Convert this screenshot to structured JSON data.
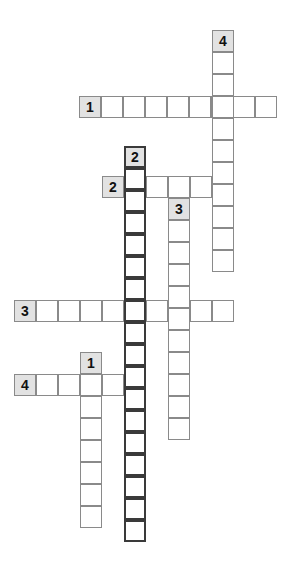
{
  "puzzle": {
    "title": "Crossword Grid",
    "cell_size": 22,
    "width": 298,
    "height": 582,
    "colors": {
      "background": "#ffffff",
      "cell_fill": "#ffffff",
      "cell_border": "#8a8a8a",
      "bold_border": "#3a3a3a",
      "clue_cell_fill": "#e2e2e2",
      "number_color": "#111111"
    },
    "entries": [
      {
        "id": "1-across",
        "number": "1",
        "direction": "across",
        "length": 9,
        "x": 79,
        "y": 96,
        "bold": false,
        "clue_cell": {
          "x": 79,
          "y": 96
        }
      },
      {
        "id": "2-across",
        "number": "2",
        "direction": "across",
        "length": 6,
        "x": 102,
        "y": 176,
        "bold": false,
        "clue_cell": {
          "x": 102,
          "y": 176
        }
      },
      {
        "id": "3-across",
        "number": "3",
        "direction": "across",
        "length": 10,
        "x": 14,
        "y": 300,
        "bold": false,
        "clue_cell": {
          "x": 14,
          "y": 300
        }
      },
      {
        "id": "4-across",
        "number": "4",
        "direction": "across",
        "length": 5,
        "x": 14,
        "y": 374,
        "bold": false,
        "clue_cell": {
          "x": 14,
          "y": 374
        }
      },
      {
        "id": "1-down",
        "number": "1",
        "direction": "down",
        "length": 8,
        "x": 80,
        "y": 352,
        "bold": false,
        "clue_cell": {
          "x": 80,
          "y": 352
        }
      },
      {
        "id": "2-down",
        "number": "2",
        "direction": "down",
        "length": 18,
        "x": 124,
        "y": 146,
        "bold": true,
        "clue_cell": {
          "x": 124,
          "y": 146
        }
      },
      {
        "id": "3-down",
        "number": "3",
        "direction": "down",
        "length": 11,
        "x": 168,
        "y": 198,
        "bold": false,
        "clue_cell": {
          "x": 168,
          "y": 198
        }
      },
      {
        "id": "4-down",
        "number": "4",
        "direction": "down",
        "length": 11,
        "x": 212,
        "y": 30,
        "bold": false,
        "clue_cell": {
          "x": 212,
          "y": 30
        }
      }
    ]
  }
}
